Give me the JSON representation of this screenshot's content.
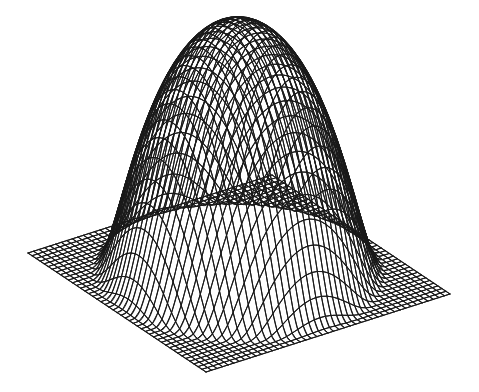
{
  "figure": {
    "title": "",
    "background_color": "#ffffff",
    "line_color": "#1a1a1a",
    "width": 479,
    "height": 392,
    "style": "wireframe-mesh-lineart"
  },
  "chart_data": {
    "type": "surface",
    "render": "wireframe-mesh",
    "title": "",
    "subtitle": "",
    "xlabel": "",
    "ylabel": "",
    "zlabel": "",
    "grid": true,
    "legend": false,
    "legend_position": "none",
    "axes_visible": false,
    "tick_labels_visible": false,
    "function": "radially symmetric compact bump (mollifier) on a flat base plane",
    "formula": "z(r) = A * exp(1 - 1/(1 - (r/R)^2)) for r < R, else 0;  r = sqrt(x^2 + y^2)",
    "amplitude": 1.0,
    "support_radius": 0.52,
    "xlim": [
      -1,
      1
    ],
    "ylim": [
      -1,
      1
    ],
    "zlim": [
      0,
      1
    ],
    "grid_divisions_x": 44,
    "grid_divisions_y": 44,
    "projection": {
      "type": "oblique-isometric",
      "azimuth_deg": 45,
      "elevation_deg": 28,
      "z_scale": 0.78
    },
    "base_plane_corners_px": {
      "left": [
        28,
        253
      ],
      "back": [
        272,
        175
      ],
      "right": [
        450,
        290
      ],
      "front": [
        206,
        372
      ]
    },
    "apex_px": [
      245,
      22
    ],
    "sample_profile_r": [
      0.0,
      0.1,
      0.2,
      0.3,
      0.35,
      0.4,
      0.45,
      0.48,
      0.5,
      0.52,
      0.6,
      0.8,
      1.0
    ],
    "sample_profile_z": [
      1.0,
      0.96,
      0.85,
      0.65,
      0.52,
      0.36,
      0.18,
      0.08,
      0.03,
      0.0,
      0.0,
      0.0,
      0.0
    ]
  }
}
